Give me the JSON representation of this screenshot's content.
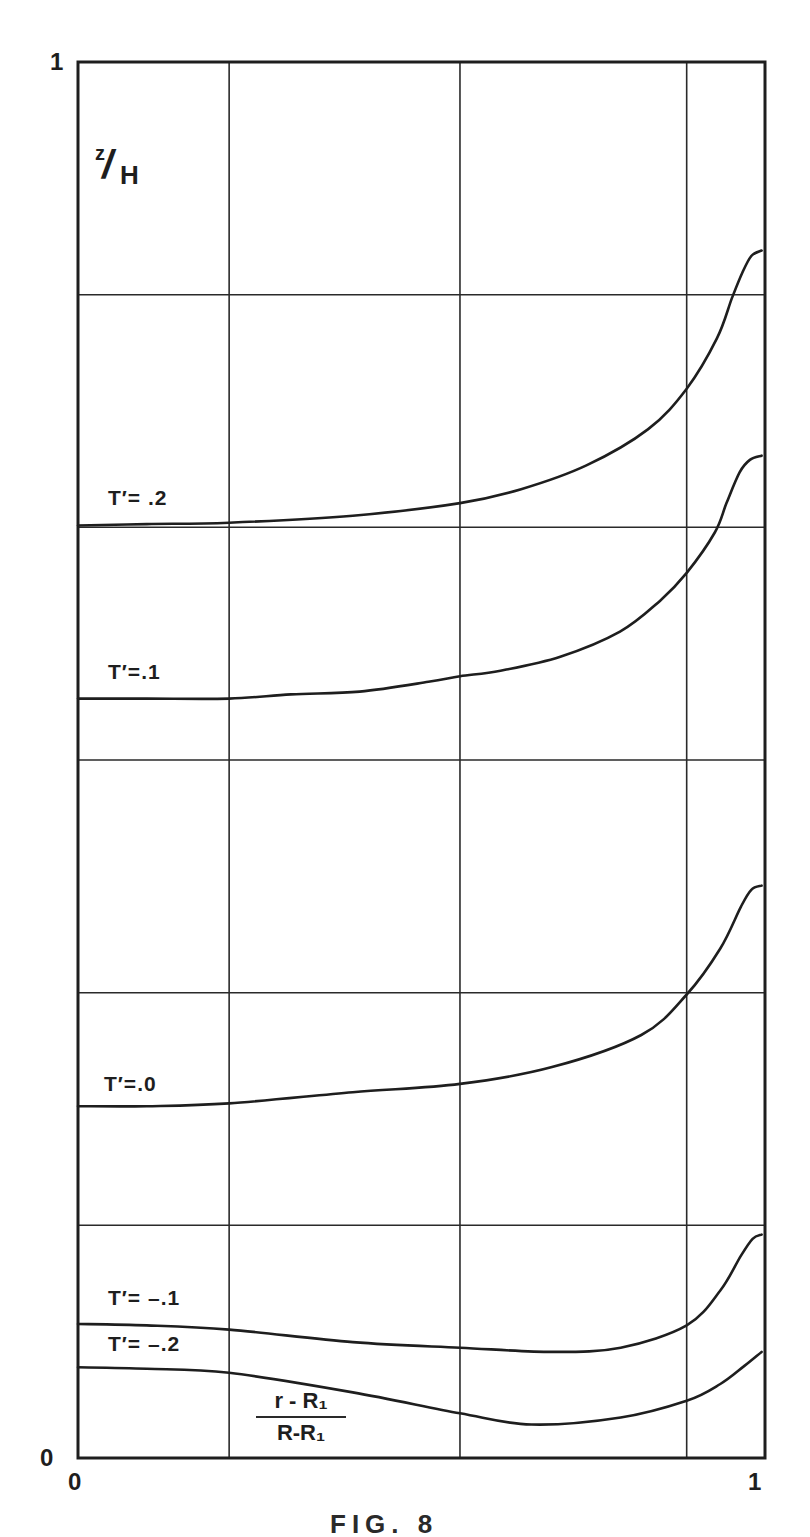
{
  "chart_data": {
    "type": "line",
    "title": "",
    "xlabel": "(r - R1)/(R - R1)",
    "ylabel": "z/H",
    "xlim": [
      0,
      1
    ],
    "ylim": [
      0,
      1
    ],
    "grid": true,
    "x_ticks": [
      "0",
      "1"
    ],
    "y_ticks": [
      "0",
      "1"
    ],
    "x_gridlines": [
      0.22,
      0.556,
      0.886
    ],
    "y_gridlines": [
      0.1667,
      0.3333,
      0.5,
      0.6667,
      0.8333
    ],
    "legend": "inline labels",
    "series": [
      {
        "name": "T'=.2",
        "x": [
          0,
          0.1,
          0.22,
          0.4,
          0.556,
          0.645,
          0.74,
          0.83,
          0.886,
          0.93,
          0.952,
          0.967,
          0.98,
          0.995
        ],
        "y": [
          0.668,
          0.669,
          0.67,
          0.675,
          0.684,
          0.694,
          0.711,
          0.737,
          0.766,
          0.802,
          0.831,
          0.849,
          0.861,
          0.865
        ]
      },
      {
        "name": "T'=.1",
        "x": [
          0,
          0.1,
          0.22,
          0.31,
          0.41,
          0.51,
          0.556,
          0.615,
          0.702,
          0.789,
          0.847,
          0.886,
          0.927,
          0.944,
          0.963,
          0.978,
          0.995
        ],
        "y": [
          0.544,
          0.544,
          0.544,
          0.547,
          0.549,
          0.556,
          0.56,
          0.564,
          0.574,
          0.592,
          0.614,
          0.634,
          0.663,
          0.684,
          0.706,
          0.715,
          0.718
        ]
      },
      {
        "name": "T'=.0",
        "x": [
          0,
          0.1,
          0.22,
          0.4,
          0.556,
          0.69,
          0.82,
          0.886,
          0.935,
          0.965,
          0.98,
          0.995
        ],
        "y": [
          0.252,
          0.252,
          0.254,
          0.262,
          0.268,
          0.28,
          0.303,
          0.332,
          0.365,
          0.395,
          0.407,
          0.41
        ]
      },
      {
        "name": "T'=-.1",
        "x": [
          0,
          0.1,
          0.22,
          0.4,
          0.556,
          0.69,
          0.79,
          0.886,
          0.935,
          0.965,
          0.982,
          0.995
        ],
        "y": [
          0.096,
          0.095,
          0.092,
          0.083,
          0.079,
          0.076,
          0.079,
          0.095,
          0.12,
          0.145,
          0.157,
          0.16
        ]
      },
      {
        "name": "T'=-.2",
        "x": [
          0,
          0.1,
          0.22,
          0.4,
          0.556,
          0.66,
          0.79,
          0.886,
          0.935,
          0.97,
          0.995
        ],
        "y": [
          0.065,
          0.064,
          0.061,
          0.047,
          0.032,
          0.024,
          0.029,
          0.041,
          0.053,
          0.066,
          0.076
        ]
      }
    ],
    "annotations": [
      "z/H",
      "T'=.2",
      "T'=.1",
      "T'=.0",
      "T'=-.1",
      "T'=-.2",
      "(r-R1)/(R-R1)"
    ]
  },
  "axes": {
    "y_top_label": "1",
    "y_bottom_label": "0",
    "x_left_label": "0",
    "x_right_label": "1",
    "ylabel_num": "z",
    "ylabel_slash": "/",
    "ylabel_den": "H",
    "xlabel_num": "r - R₁",
    "xlabel_den": "R-R₁"
  },
  "curve_labels": {
    "t02": "T′= .2",
    "t01": "T′=.1",
    "t00": "T′=.0",
    "tm01": "T′= –.1",
    "tm02": "T′= –.2"
  },
  "caption": "FIG. 8",
  "colors": {
    "ink": "#1e1e1e",
    "grid": "#2a2a2a",
    "background": "#ffffff"
  }
}
